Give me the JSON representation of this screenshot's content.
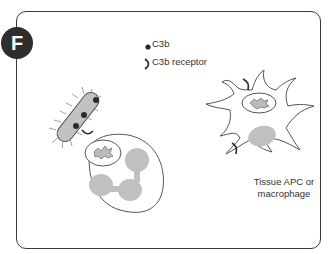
{
  "panel": {
    "badge": "F"
  },
  "legend": {
    "items": [
      {
        "icon": "c3b-dot-icon",
        "label": "C3b"
      },
      {
        "icon": "c3b-receptor-icon",
        "label": "C3b receptor"
      }
    ]
  },
  "cells": {
    "bacterium": {
      "label": ""
    },
    "neutrophil": {
      "label": ""
    },
    "apc": {
      "label_line1": "Tissue APC or",
      "label_line2": "macrophage"
    }
  },
  "colors": {
    "outline": "#3a3a3a",
    "fill_gray": "#bdbdbd",
    "dot": "#2a2a2a",
    "badge_bg": "#2e2e2e"
  }
}
